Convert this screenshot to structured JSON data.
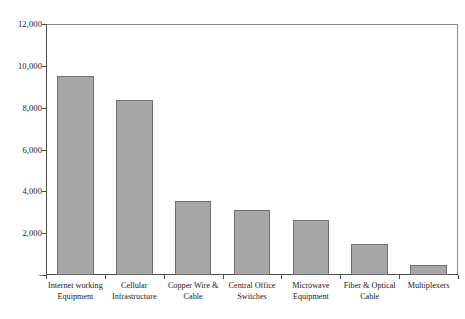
{
  "chart_data": {
    "type": "bar",
    "title": "",
    "subtitle": "",
    "xlabel": "",
    "ylabel": "",
    "ylim": [
      0,
      12000
    ],
    "ytick_values": [
      0,
      2000,
      4000,
      6000,
      8000,
      10000,
      12000
    ],
    "ytick_labels": [
      "-",
      "2,000",
      "4,000",
      "6,000",
      "8,000",
      "10,000",
      "12,000"
    ],
    "grid": false,
    "legend": "none",
    "bar_color": "#a6a6a6",
    "bar_border_color": "#6e6e6e",
    "axis_color": "#4a4a4a",
    "categories": [
      "Internet working Equipment",
      "Cellular Infrastructure",
      "Copper Wire & Cable",
      "Central Office Switches",
      "Microwave Equipment",
      "Fiber & Optical Cable",
      "Multiplexers"
    ],
    "values": [
      9500,
      8350,
      3550,
      3100,
      2650,
      1500,
      500
    ]
  },
  "caption": {
    "text": ""
  }
}
